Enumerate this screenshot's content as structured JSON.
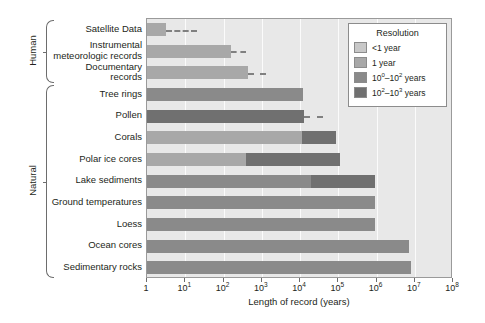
{
  "chart_data": {
    "type": "bar",
    "orientation": "horizontal",
    "title": "",
    "xlabel": "Length of record (years)",
    "ylabel": "",
    "xscale": "log",
    "xlim": [
      1,
      100000000
    ],
    "xticks": [
      {
        "value": 1,
        "label": "1",
        "exp": ""
      },
      {
        "value": 10,
        "label": "10",
        "exp": "1"
      },
      {
        "value": 100,
        "label": "10",
        "exp": "2"
      },
      {
        "value": 1000,
        "label": "10",
        "exp": "3"
      },
      {
        "value": 10000,
        "label": "10",
        "exp": "4"
      },
      {
        "value": 100000,
        "label": "10",
        "exp": "5"
      },
      {
        "value": 1000000,
        "label": "10",
        "exp": "6"
      },
      {
        "value": 10000000,
        "label": "10",
        "exp": "7"
      },
      {
        "value": 100000000,
        "label": "10",
        "exp": "8"
      }
    ],
    "grid": true,
    "legend": {
      "title": "Resolution",
      "position": "top-right",
      "entries": [
        {
          "label": "<1 year",
          "label_base": "<1 year",
          "color": "#c8c8c8"
        },
        {
          "label": "1 year",
          "label_base": "1 year",
          "color": "#a8a8a8"
        },
        {
          "label": "10^0-10^2 years",
          "base": "10",
          "sup1": "0",
          "mid": "–10",
          "sup2": "2",
          "tail": " years",
          "color": "#8a8a8a"
        },
        {
          "label": "10^2-10^3 years",
          "base": "10",
          "sup1": "2",
          "mid": "–10",
          "sup2": "3",
          "tail": " years",
          "color": "#707070"
        }
      ]
    },
    "groups": [
      {
        "name": "Human",
        "rows": [
          0,
          1,
          2
        ]
      },
      {
        "name": "Natural",
        "rows": [
          3,
          4,
          5,
          6,
          7,
          8,
          9,
          10,
          11
        ]
      }
    ],
    "categories": [
      "Satellite Data",
      "Instrumental meteorologic records",
      "Documentary records",
      "Tree rings",
      "Pollen",
      "Corals",
      "Polar ice cores",
      "Lake sediments",
      "Ground temperatures",
      "Loess",
      "Ocean cores",
      "Sedimentary rocks"
    ],
    "category_lines": [
      [
        "Satellite Data"
      ],
      [
        "Instrumental",
        "meteorologic records"
      ],
      [
        "Documentary",
        "records"
      ],
      [
        "Tree rings"
      ],
      [
        "Pollen"
      ],
      [
        "Corals"
      ],
      [
        "Polar ice cores"
      ],
      [
        "Lake sediments"
      ],
      [
        "Ground temperatures"
      ],
      [
        "Loess"
      ],
      [
        "Ocean cores"
      ],
      [
        "Sedimentary rocks"
      ]
    ],
    "bars": [
      {
        "category": "Satellite Data",
        "segments": [
          {
            "start_exp": 0,
            "end_exp": 0.5,
            "color": "#a8a8a8",
            "resolution": "1 year"
          }
        ],
        "dashed_end_exp": 1.3
      },
      {
        "category": "Instrumental meteorologic records",
        "segments": [
          {
            "start_exp": 0,
            "end_exp": 2.2,
            "color": "#a8a8a8",
            "resolution": "1 year"
          }
        ],
        "dashed_end_exp": 2.6
      },
      {
        "category": "Documentary records",
        "segments": [
          {
            "start_exp": 0,
            "end_exp": 2.65,
            "color": "#a8a8a8",
            "resolution": "1 year"
          }
        ],
        "dashed_end_exp": 3.1
      },
      {
        "category": "Tree rings",
        "segments": [
          {
            "start_exp": 0,
            "end_exp": 4.07,
            "color": "#8a8a8a",
            "resolution": "1 year"
          }
        ],
        "dashed_end_exp": null
      },
      {
        "category": "Pollen",
        "segments": [
          {
            "start_exp": 0,
            "end_exp": 4.1,
            "color": "#707070",
            "resolution": "10^2-10^3 years"
          }
        ],
        "dashed_end_exp": 4.6
      },
      {
        "category": "Corals",
        "segments": [
          {
            "start_exp": 0,
            "end_exp": 4.05,
            "color": "#a8a8a8",
            "resolution": "1 year"
          },
          {
            "start_exp": 4.05,
            "end_exp": 4.95,
            "color": "#707070",
            "resolution": "10^2-10^3 years"
          }
        ],
        "dashed_end_exp": null
      },
      {
        "category": "Polar ice cores",
        "segments": [
          {
            "start_exp": 0,
            "end_exp": 2.6,
            "color": "#a8a8a8",
            "resolution": "1 year"
          },
          {
            "start_exp": 2.6,
            "end_exp": 5.05,
            "color": "#707070",
            "resolution": "10^2-10^3 years"
          }
        ],
        "dashed_end_exp": null
      },
      {
        "category": "Lake sediments",
        "segments": [
          {
            "start_exp": 0,
            "end_exp": 4.3,
            "color": "#8a8a8a",
            "resolution": "10^0-10^2 years"
          },
          {
            "start_exp": 4.3,
            "end_exp": 5.95,
            "color": "#707070",
            "resolution": "10^2-10^3 years"
          }
        ],
        "dashed_end_exp": null
      },
      {
        "category": "Ground temperatures",
        "segments": [
          {
            "start_exp": 0,
            "end_exp": 5.95,
            "color": "#8a8a8a",
            "resolution": "10^0-10^2 years"
          }
        ],
        "dashed_end_exp": null
      },
      {
        "category": "Loess",
        "segments": [
          {
            "start_exp": 0,
            "end_exp": 5.95,
            "color": "#8a8a8a",
            "resolution": "10^0-10^2 years"
          }
        ],
        "dashed_end_exp": null
      },
      {
        "category": "Ocean cores",
        "segments": [
          {
            "start_exp": 0,
            "end_exp": 6.85,
            "color": "#8a8a8a",
            "resolution": "10^0-10^2 years"
          }
        ],
        "dashed_end_exp": null
      },
      {
        "category": "Sedimentary rocks",
        "segments": [
          {
            "start_exp": 0,
            "end_exp": 6.9,
            "color": "#8a8a8a",
            "resolution": "10^0-10^2 years"
          }
        ],
        "dashed_end_exp": null
      }
    ]
  }
}
